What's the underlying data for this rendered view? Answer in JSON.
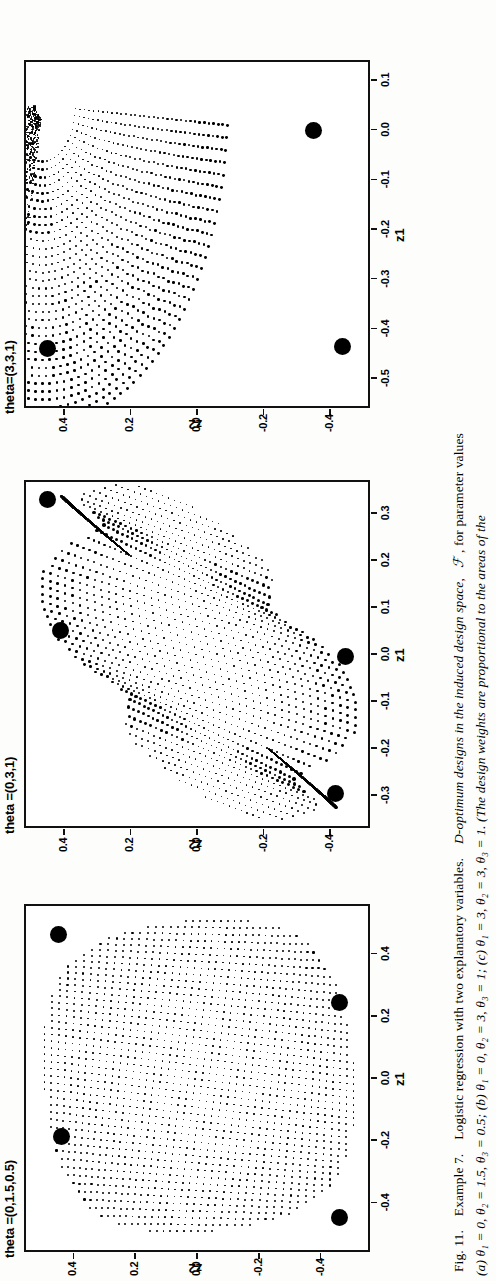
{
  "figure": {
    "number": "Fig. 11.",
    "caption_line1": "Fig. 11.  Example 7.  Logistic regression with two explanatory variables.  D-optimum designs in the induced design space,  ℱ, for parameter values",
    "caption_line2": "(a) θ₁ = 0, θ₂ = 1.5, θ₃ = 0.5; (b) θ₁ = 0, θ₂ = 3, θ₃ = 1; (c) θ₁ = 3, θ₂ = 3, θ₃ = 1.  (The design weights are proportional to the areas of the",
    "caption_label": "Fig. 11.",
    "caption_example": "Example 7.",
    "caption_sentence": "Logistic regression with two explanatory variables.",
    "caption_main": "D-optimum designs in the induced design space,",
    "caption_symbol": "ℱ",
    "caption_tail": ", for parameter values",
    "caption_params": "(a) θ₁ = 0, θ₂ = 1.5, θ₃ = 0.5; (b) θ₁ = 0, θ₂ = 3, θ₃ = 1; (c) θ₁ = 3, θ₂ = 3, θ₃ = 1.  (The design weights are proportional to the areas of the"
  },
  "axis": {
    "xlabel": "z1",
    "ylabel": "z2"
  },
  "chart_data": [
    {
      "type": "scatter",
      "title": "theta =(0,1.5,0.5)",
      "xlabel": "z1",
      "ylabel": "z2",
      "xlim": [
        -0.56,
        0.56
      ],
      "ylim": [
        -0.56,
        0.56
      ],
      "xticks": [
        "-0.4",
        "-0.2",
        "0.0",
        "0.2",
        "0.4"
      ],
      "xtickvals": [
        -0.4,
        -0.2,
        0.0,
        0.2,
        0.4
      ],
      "yticks": [
        "-0.4",
        "-0.2",
        "0.0",
        "0.2",
        "0.4"
      ],
      "ytickvals": [
        -0.4,
        -0.2,
        0.0,
        0.2,
        0.4
      ],
      "grid": false,
      "legend": "none",
      "design_points": [
        {
          "x": 0.455,
          "y": 0.455,
          "weight": 0.25
        },
        {
          "x": 0.235,
          "y": -0.455,
          "weight": 0.25
        },
        {
          "x": -0.195,
          "y": 0.445,
          "weight": 0.25
        },
        {
          "x": -0.455,
          "y": -0.455,
          "weight": 0.25
        }
      ],
      "cloud": {
        "shape": "lens",
        "n_rows": 46,
        "n_cols": 46,
        "description": "dense grid of small dots filling a curvilinear quadrilateral (induced design space) spanning the full axis range"
      }
    },
    {
      "type": "scatter",
      "title": "theta =(0,3,1)",
      "xlabel": "z1",
      "ylabel": "z2",
      "xlim": [
        -0.37,
        0.37
      ],
      "ylim": [
        -0.52,
        0.52
      ],
      "xticks": [
        "-0.3",
        "-0.2",
        "-0.1",
        "0.0",
        "0.1",
        "0.2",
        "0.3"
      ],
      "xtickvals": [
        -0.3,
        -0.2,
        -0.1,
        0.0,
        0.1,
        0.2,
        0.3
      ],
      "yticks": [
        "-0.4",
        "-0.2",
        "0.0",
        "0.2",
        "0.4"
      ],
      "ytickvals": [
        -0.4,
        -0.2,
        0.0,
        0.2,
        0.4
      ],
      "grid": false,
      "legend": "none",
      "design_points": [
        {
          "x": 0.325,
          "y": 0.455,
          "weight": 0.25
        },
        {
          "x": 0.045,
          "y": 0.415,
          "weight": 0.25
        },
        {
          "x": -0.01,
          "y": -0.44,
          "weight": 0.25
        },
        {
          "x": -0.3,
          "y": -0.41,
          "weight": 0.25
        }
      ],
      "cloud": {
        "shape": "bowtie",
        "n_rows": 40,
        "n_cols": 40,
        "description": "slanted lens-shaped dot cloud with two dense cusps along the diagonal"
      }
    },
    {
      "type": "scatter",
      "title": "theta=(3,3,1)",
      "xlabel": "z1",
      "ylabel": "z2",
      "xlim": [
        -0.56,
        0.14
      ],
      "ylim": [
        -0.52,
        0.52
      ],
      "xticks": [
        "-0.5",
        "-0.4",
        "-0.3",
        "-0.2",
        "-0.1",
        "0.0",
        "0.1"
      ],
      "xtickvals": [
        -0.5,
        -0.4,
        -0.3,
        -0.2,
        -0.1,
        0.0,
        0.1
      ],
      "yticks": [
        "-0.4",
        "-0.2",
        "0.0",
        "0.2",
        "0.4"
      ],
      "ytickvals": [
        -0.4,
        -0.2,
        0.0,
        0.2,
        0.4
      ],
      "grid": false,
      "legend": "none",
      "design_points": [
        {
          "x": -0.005,
          "y": -0.345,
          "weight": 0.25
        },
        {
          "x": -0.445,
          "y": 0.455,
          "weight": 0.25
        },
        {
          "x": -0.44,
          "y": -0.43,
          "weight": 0.25
        }
      ],
      "cloud": {
        "shape": "fan",
        "n_rows": 34,
        "n_cols": 40,
        "description": "fan of nested arcs converging to a dense wedge near the upper-right corner"
      }
    }
  ]
}
